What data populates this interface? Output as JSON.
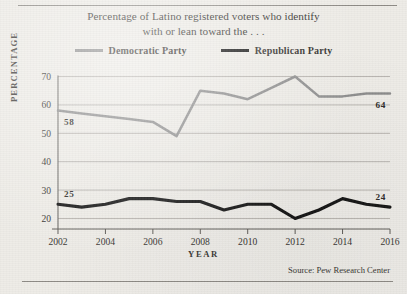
{
  "figure": {
    "title_line1": "Percentage of Latino registered voters who identify",
    "title_line2": "with or lean toward the . . .",
    "source": "Source:  Pew Research Center",
    "background_color": "#eeece7"
  },
  "legend": {
    "position": "top",
    "items": [
      {
        "label": "Democratic Party",
        "color": "#8d8d8d"
      },
      {
        "label": "Republican Party",
        "color": "#141414"
      }
    ]
  },
  "chart_data": {
    "type": "line",
    "title": "Percentage of Latino registered voters who identify with or lean toward the . . .",
    "xlabel": "YEAR",
    "ylabel": "PERCENTAGE",
    "xlim": [
      2002,
      2016
    ],
    "ylim": [
      15,
      72
    ],
    "grid": true,
    "grid_axis": "y",
    "xticks": [
      2002,
      2004,
      2006,
      2008,
      2010,
      2012,
      2014,
      2016
    ],
    "xtick_labels": [
      "2002",
      "2004",
      "2006",
      "2008",
      "2010",
      "2012",
      "2014",
      "2016"
    ],
    "yticks": [
      20,
      30,
      40,
      50,
      60,
      70
    ],
    "ytick_labels": [
      "20",
      "30",
      "40",
      "50",
      "60",
      "70"
    ],
    "x": [
      2002,
      2003,
      2004,
      2005,
      2006,
      2007,
      2008,
      2009,
      2010,
      2011,
      2012,
      2013,
      2014,
      2015,
      2016
    ],
    "series": [
      {
        "name": "Democratic Party",
        "color": "#8d8d8d",
        "values": [
          58,
          57,
          56,
          55,
          54,
          49,
          65,
          64,
          62,
          66,
          70,
          63,
          63,
          64,
          64
        ],
        "endpoint_labels": [
          {
            "x": 2002,
            "value": 58,
            "text": "58"
          },
          {
            "x": 2016,
            "value": 64,
            "text": "64"
          }
        ]
      },
      {
        "name": "Republican Party",
        "color": "#141414",
        "values": [
          25,
          24,
          25,
          27,
          27,
          26,
          26,
          23,
          25,
          25,
          20,
          23,
          27,
          25,
          24
        ],
        "endpoint_labels": [
          {
            "x": 2002,
            "value": 25,
            "text": "25"
          },
          {
            "x": 2016,
            "value": 24,
            "text": "24"
          }
        ]
      }
    ]
  }
}
